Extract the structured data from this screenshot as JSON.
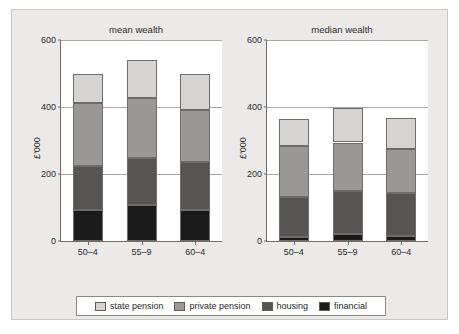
{
  "chart_data": {
    "type": "bar",
    "title": "",
    "subplots": [
      {
        "title": "mean wealth",
        "ylabel": "£'000",
        "xlabel": "",
        "categories": [
          "50–4",
          "55–9",
          "60–4"
        ],
        "ylim": [
          0,
          600
        ],
        "yticks": [
          0,
          200,
          400,
          600
        ],
        "ytick_labels": [
          "0",
          "200",
          "400",
          "600"
        ],
        "grid": true,
        "stacked": true,
        "series": [
          {
            "name": "financial",
            "values": [
              93,
              106,
              93
            ]
          },
          {
            "name": "housing",
            "values": [
              132,
              141,
              142
            ]
          },
          {
            "name": "private pension",
            "values": [
              187,
              181,
              155
            ]
          },
          {
            "name": "state pension",
            "values": [
              88,
              112,
              110
            ]
          }
        ],
        "cumulative_tops": [
          {
            "financial": 93,
            "housing": 225,
            "private pension": 412,
            "state pension": 500
          },
          {
            "financial": 106,
            "housing": 247,
            "private pension": 428,
            "state pension": 540
          },
          {
            "financial": 93,
            "housing": 235,
            "private pension": 390,
            "state pension": 500
          }
        ],
        "totals": [
          500,
          540,
          500
        ]
      },
      {
        "title": "median wealth",
        "ylabel": "£'000",
        "xlabel": "",
        "categories": [
          "50–4",
          "55–9",
          "60–4"
        ],
        "ylim": [
          0,
          600
        ],
        "yticks": [
          0,
          200,
          400,
          600
        ],
        "ytick_labels": [
          "0",
          "200",
          "400",
          "600"
        ],
        "grid": true,
        "stacked": true,
        "series": [
          {
            "name": "financial",
            "values": [
              13,
              20,
              15
            ]
          },
          {
            "name": "housing",
            "values": [
              117,
              128,
              128
            ]
          },
          {
            "name": "private pension",
            "values": [
              155,
              146,
              132
            ]
          },
          {
            "name": "state pension",
            "values": [
              80,
              104,
              93
            ]
          }
        ],
        "cumulative_tops": [
          {
            "financial": 13,
            "housing": 130,
            "private pension": 285,
            "state pension": 365
          },
          {
            "financial": 20,
            "housing": 148,
            "private pension": 294,
            "state pension": 398
          },
          {
            "financial": 15,
            "housing": 143,
            "private pension": 275,
            "state pension": 368
          }
        ],
        "totals": [
          365,
          398,
          368
        ]
      }
    ],
    "legend": {
      "position": "bottom",
      "entries": [
        {
          "label": "state pension",
          "color": "#d6d4d3"
        },
        {
          "label": "private pension",
          "color": "#9a9897"
        },
        {
          "label": "housing",
          "color": "#575554"
        },
        {
          "label": "financial",
          "color": "#1c1b1b"
        }
      ]
    },
    "colors": {
      "state_pension": "#d6d4d3",
      "private_pension": "#9a9897",
      "housing": "#575554",
      "financial": "#1c1b1b",
      "figure_background": "#eceae9",
      "plot_background": "#ffffff",
      "axis": "#6e6c6b",
      "gridline": "#a9a7a6"
    }
  }
}
